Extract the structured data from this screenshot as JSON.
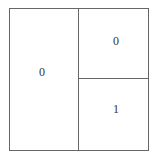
{
  "diagram": {
    "regions": [
      {
        "label": "0"
      },
      {
        "label": "0"
      },
      {
        "label": "1"
      }
    ]
  }
}
